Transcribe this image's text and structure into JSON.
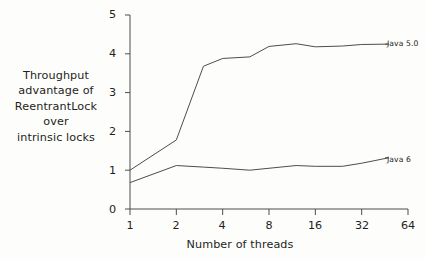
{
  "chart_data": {
    "type": "line",
    "title": "",
    "xlabel": "Number of threads",
    "ylabel_lines": [
      "Throughput",
      "advantage of",
      "ReentrantLock",
      "over",
      "intrinsic locks"
    ],
    "ylabel": "Throughput advantage of ReentrantLock over intrinsic locks",
    "x_scale": "log2",
    "x_tick_labels": [
      "1",
      "2",
      "4",
      "8",
      "16",
      "32",
      "64"
    ],
    "x_tick_values": [
      1,
      2,
      4,
      8,
      16,
      32,
      64
    ],
    "xlim": [
      1,
      64
    ],
    "y_tick_labels": [
      "0",
      "1",
      "2",
      "3",
      "4",
      "5"
    ],
    "y_tick_values": [
      0,
      1,
      2,
      3,
      4,
      5
    ],
    "ylim": [
      0,
      5
    ],
    "grid": false,
    "legend_position": "right-inline-annotations",
    "line_color": "#4d4d4d",
    "axis_color": "#4d4d4d",
    "background": "#fdfdfc",
    "series": [
      {
        "name": "Java 5.0",
        "label": "Java 5.0",
        "x": [
          1,
          2,
          3,
          4,
          6,
          8,
          12,
          16,
          24,
          32,
          48
        ],
        "values": [
          1.0,
          1.78,
          3.68,
          3.88,
          3.92,
          4.19,
          4.26,
          4.18,
          4.2,
          4.24,
          4.25
        ]
      },
      {
        "name": "Java 6",
        "label": "Java 6",
        "x": [
          1,
          2,
          3,
          4,
          6,
          8,
          12,
          16,
          24,
          32,
          48
        ],
        "values": [
          0.68,
          1.12,
          1.08,
          1.05,
          1.0,
          1.05,
          1.12,
          1.1,
          1.1,
          1.18,
          1.32
        ]
      }
    ],
    "annotations": [
      {
        "text": "Java 5.0",
        "at_x": 48,
        "at_y": 4.25
      },
      {
        "text": "Java 6",
        "at_x": 48,
        "at_y": 1.32
      }
    ]
  },
  "axis": {
    "y_ticks": [
      {
        "label": "5"
      },
      {
        "label": "4"
      },
      {
        "label": "3"
      },
      {
        "label": "2"
      },
      {
        "label": "1"
      },
      {
        "label": "0"
      }
    ],
    "x_ticks": [
      {
        "label": "1"
      },
      {
        "label": "2"
      },
      {
        "label": "4"
      },
      {
        "label": "8"
      },
      {
        "label": "16"
      },
      {
        "label": "32"
      },
      {
        "label": "64"
      }
    ]
  },
  "labels": {
    "y_axis_title_lines": [
      "Throughput",
      "advantage of",
      "ReentrantLock",
      "over",
      "intrinsic locks"
    ],
    "x_axis_title": "Number of threads",
    "series_java5": "Java 5.0",
    "series_java6": "Java 6"
  }
}
